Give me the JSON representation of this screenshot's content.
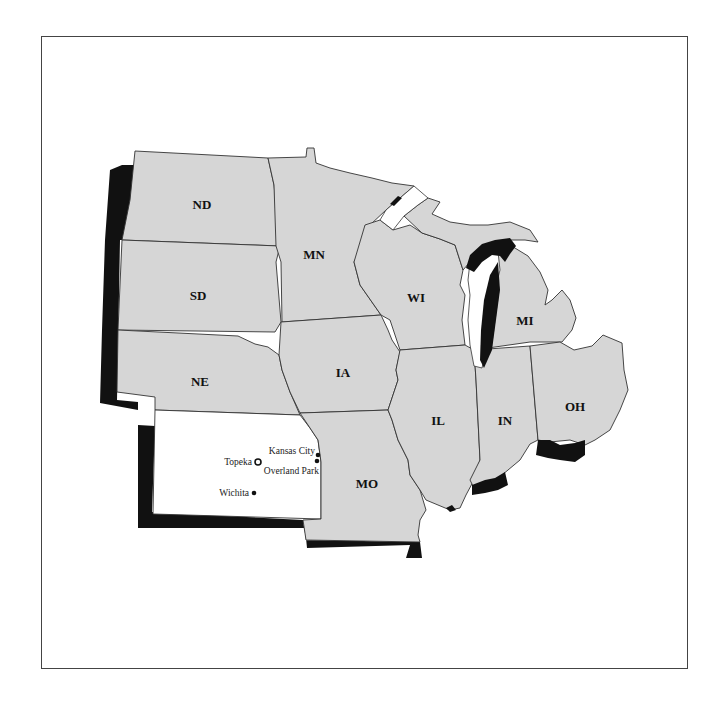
{
  "map": {
    "title": "",
    "region": "Midwest United States",
    "highlighted_state": "Kansas",
    "colors": {
      "state_fill": "#d6d6d6",
      "highlight_fill": "#ffffff",
      "shadow": "#111111",
      "border": "#333333"
    },
    "states": [
      {
        "abbr": "ND",
        "x": 202,
        "y": 209
      },
      {
        "abbr": "SD",
        "x": 198,
        "y": 300
      },
      {
        "abbr": "NE",
        "x": 200,
        "y": 386
      },
      {
        "abbr": "MN",
        "x": 314,
        "y": 259
      },
      {
        "abbr": "WI",
        "x": 416,
        "y": 302
      },
      {
        "abbr": "IA",
        "x": 343,
        "y": 377
      },
      {
        "abbr": "MI",
        "x": 525,
        "y": 325
      },
      {
        "abbr": "IL",
        "x": 438,
        "y": 425
      },
      {
        "abbr": "IN",
        "x": 505,
        "y": 425
      },
      {
        "abbr": "OH",
        "x": 575,
        "y": 411
      },
      {
        "abbr": "MO",
        "x": 367,
        "y": 488
      }
    ],
    "cities": [
      {
        "name": "Kansas City",
        "marker": "dot",
        "x": 318,
        "y": 455
      },
      {
        "name": "Topeka",
        "marker": "capital-star",
        "x": 258,
        "y": 462
      },
      {
        "name": "Overland Park",
        "marker": "dot",
        "x": 317,
        "y": 461
      },
      {
        "name": "Wichita",
        "marker": "dot",
        "x": 254,
        "y": 493
      }
    ]
  }
}
